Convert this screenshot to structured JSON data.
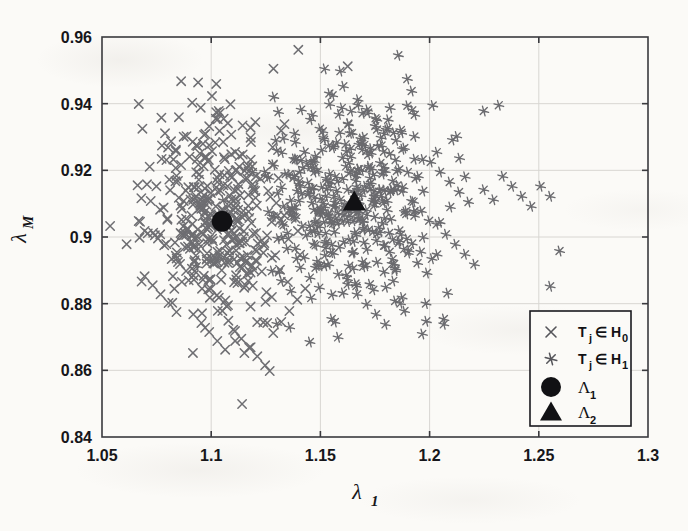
{
  "figure": {
    "background_color": "#fbfaf7",
    "axis_color": "#3a3a3e",
    "grid_color": "#d8d6d2",
    "marker_h0_color": "#6e6e72",
    "marker_h1_color": "#6a6a6e",
    "centroid_color": "#111114"
  },
  "chart_data": {
    "type": "scatter",
    "title": "",
    "xlabel": "λ",
    "xlabel_sub": "1",
    "ylabel": "λ",
    "ylabel_sub": "M",
    "xlim": [
      1.05,
      1.3
    ],
    "ylim": [
      0.84,
      0.96
    ],
    "xticks": [
      1.05,
      1.1,
      1.15,
      1.2,
      1.25,
      1.3
    ],
    "xtick_labels": [
      "1.05",
      "1.1",
      "1.15",
      "1.2",
      "1.25",
      "1.3"
    ],
    "yticks": [
      0.84,
      0.86,
      0.88,
      0.9,
      0.92,
      0.94,
      0.96
    ],
    "ytick_labels": [
      "0.84",
      "0.86",
      "0.88",
      "0.9",
      "0.92",
      "0.94",
      "0.96"
    ],
    "grid": true,
    "legend_position": "lower right",
    "series": [
      {
        "name": "T_j \\in H_0",
        "marker": "x",
        "color": "#6e6e72",
        "center": [
          1.105,
          0.9047
        ],
        "n_points": 420,
        "points": [
          [
            1.0685,
            0.9325
          ],
          [
            1.0772,
            0.9358
          ],
          [
            1.0913,
            0.9403
          ],
          [
            1.0952,
            0.9388
          ],
          [
            1.0991,
            0.9332
          ],
          [
            1.0816,
            0.9287
          ],
          [
            1.0874,
            0.9301
          ],
          [
            1.0931,
            0.9275
          ],
          [
            1.1021,
            0.9355
          ],
          [
            1.1088,
            0.9398
          ],
          [
            1.0663,
            0.9155
          ],
          [
            1.0706,
            0.9158
          ],
          [
            1.0749,
            0.9152
          ],
          [
            1.0668,
            0.9048
          ],
          [
            1.0672,
            0.8998
          ],
          [
            1.0795,
            0.9231
          ],
          [
            1.0838,
            0.9262
          ],
          [
            1.0862,
            0.9216
          ],
          [
            1.0901,
            0.9241
          ],
          [
            1.0946,
            0.9188
          ],
          [
            1.0723,
            0.9108
          ],
          [
            1.0766,
            0.9082
          ],
          [
            1.0799,
            0.9052
          ],
          [
            1.0742,
            0.9005
          ],
          [
            1.0785,
            0.8975
          ],
          [
            1.0848,
            0.9168
          ],
          [
            1.0884,
            0.9139
          ],
          [
            1.0918,
            0.9112
          ],
          [
            1.0955,
            0.9085
          ],
          [
            1.0992,
            0.9058
          ],
          [
            1.0872,
            0.9032
          ],
          [
            1.0908,
            0.9005
          ],
          [
            1.0944,
            0.8978
          ],
          [
            1.0981,
            0.8951
          ],
          [
            1.1018,
            0.8925
          ],
          [
            1.1055,
            0.9285
          ],
          [
            1.1092,
            0.9248
          ],
          [
            1.1128,
            0.9211
          ],
          [
            1.1165,
            0.9175
          ],
          [
            1.1201,
            0.9138
          ],
          [
            1.1038,
            0.9188
          ],
          [
            1.1075,
            0.9152
          ],
          [
            1.1111,
            0.9115
          ],
          [
            1.1148,
            0.9078
          ],
          [
            1.1184,
            0.9042
          ],
          [
            1.1021,
            0.9092
          ],
          [
            1.1058,
            0.9055
          ],
          [
            1.1094,
            0.9018
          ],
          [
            1.1131,
            0.8982
          ],
          [
            1.1167,
            0.8945
          ],
          [
            1.1004,
            0.8995
          ],
          [
            1.1041,
            0.8958
          ],
          [
            1.1077,
            0.8922
          ],
          [
            1.1114,
            0.8885
          ],
          [
            1.1151,
            0.8848
          ],
          [
            1.0925,
            0.8898
          ],
          [
            1.0962,
            0.8872
          ],
          [
            1.0998,
            0.8845
          ],
          [
            1.1035,
            0.8818
          ],
          [
            1.1071,
            0.8792
          ],
          [
            1.0848,
            0.8925
          ],
          [
            1.0885,
            0.8898
          ],
          [
            1.0921,
            0.8872
          ],
          [
            1.0958,
            0.8845
          ],
          [
            1.0994,
            0.8818
          ],
          [
            1.1205,
            0.9012
          ],
          [
            1.1242,
            0.8975
          ],
          [
            1.1278,
            0.8938
          ],
          [
            1.1315,
            0.8902
          ],
          [
            1.1351,
            0.8865
          ],
          [
            1.1188,
            0.9212
          ],
          [
            1.1225,
            0.9175
          ],
          [
            1.1261,
            0.9138
          ],
          [
            1.1298,
            0.9102
          ],
          [
            1.1334,
            0.9065
          ],
          [
            1.0918,
            0.8768
          ],
          [
            1.0955,
            0.8742
          ],
          [
            1.0991,
            0.8715
          ],
          [
            1.1028,
            0.8688
          ],
          [
            1.1064,
            0.8662
          ],
          [
            1.1101,
            0.8722
          ],
          [
            1.1138,
            0.8695
          ],
          [
            1.1174,
            0.8668
          ],
          [
            1.1211,
            0.8642
          ],
          [
            1.1247,
            0.8615
          ],
          [
            1.1284,
            0.8712
          ],
          [
            1.1321,
            0.8745
          ],
          [
            1.1358,
            0.8778
          ],
          [
            1.1394,
            0.8812
          ],
          [
            1.1431,
            0.8845
          ],
          [
            1.0695,
            0.8882
          ],
          [
            1.0732,
            0.8855
          ],
          [
            1.0768,
            0.8828
          ],
          [
            1.0805,
            0.8802
          ],
          [
            1.0841,
            0.8775
          ],
          [
            1.1285,
            0.9505
          ],
          [
            1.1625,
            0.9512
          ],
          [
            1.0695,
            0.9018
          ],
          [
            1.1268,
            0.8598
          ],
          [
            1.1152,
            0.8652
          ]
        ]
      },
      {
        "name": "T_j \\in H_1",
        "marker": "asterisk",
        "color": "#6a6a6e",
        "center": [
          1.165,
          0.9105
        ],
        "n_points": 430,
        "points": [
          [
            1.1412,
            0.9382
          ],
          [
            1.1455,
            0.9352
          ],
          [
            1.1498,
            0.9325
          ],
          [
            1.1542,
            0.9398
          ],
          [
            1.1585,
            0.9368
          ],
          [
            1.1628,
            0.9338
          ],
          [
            1.1672,
            0.9412
          ],
          [
            1.1715,
            0.9382
          ],
          [
            1.1758,
            0.9352
          ],
          [
            1.1802,
            0.9322
          ],
          [
            1.1385,
            0.9285
          ],
          [
            1.1428,
            0.9255
          ],
          [
            1.1472,
            0.9228
          ],
          [
            1.1515,
            0.9298
          ],
          [
            1.1558,
            0.9268
          ],
          [
            1.1602,
            0.9238
          ],
          [
            1.1645,
            0.9312
          ],
          [
            1.1688,
            0.9282
          ],
          [
            1.1732,
            0.9252
          ],
          [
            1.1775,
            0.9222
          ],
          [
            1.1358,
            0.9188
          ],
          [
            1.1402,
            0.9158
          ],
          [
            1.1445,
            0.9128
          ],
          [
            1.1488,
            0.9198
          ],
          [
            1.1532,
            0.9168
          ],
          [
            1.1575,
            0.9138
          ],
          [
            1.1618,
            0.9212
          ],
          [
            1.1662,
            0.9182
          ],
          [
            1.1705,
            0.9152
          ],
          [
            1.1748,
            0.9122
          ],
          [
            1.1332,
            0.9092
          ],
          [
            1.1375,
            0.9062
          ],
          [
            1.1418,
            0.9032
          ],
          [
            1.1462,
            0.9102
          ],
          [
            1.1505,
            0.9072
          ],
          [
            1.1548,
            0.9042
          ],
          [
            1.1592,
            0.9112
          ],
          [
            1.1635,
            0.9082
          ],
          [
            1.1678,
            0.9052
          ],
          [
            1.1722,
            0.9022
          ],
          [
            1.1305,
            0.8995
          ],
          [
            1.1348,
            0.8965
          ],
          [
            1.1392,
            0.8935
          ],
          [
            1.1435,
            0.9005
          ],
          [
            1.1478,
            0.8975
          ],
          [
            1.1522,
            0.8945
          ],
          [
            1.1565,
            0.9015
          ],
          [
            1.1608,
            0.8985
          ],
          [
            1.1652,
            0.8955
          ],
          [
            1.1695,
            0.8925
          ],
          [
            1.1788,
            0.9198
          ],
          [
            1.1832,
            0.9168
          ],
          [
            1.1875,
            0.9138
          ],
          [
            1.1918,
            0.9108
          ],
          [
            1.1962,
            0.9078
          ],
          [
            1.2005,
            0.9225
          ],
          [
            1.2048,
            0.9195
          ],
          [
            1.2092,
            0.9165
          ],
          [
            1.2135,
            0.9135
          ],
          [
            1.2178,
            0.9105
          ],
          [
            1.1815,
            0.9012
          ],
          [
            1.1858,
            0.8982
          ],
          [
            1.1902,
            0.8952
          ],
          [
            1.1945,
            0.8922
          ],
          [
            1.1988,
            0.8892
          ],
          [
            1.2032,
            0.9038
          ],
          [
            1.2075,
            0.9008
          ],
          [
            1.2118,
            0.8978
          ],
          [
            1.2162,
            0.8948
          ],
          [
            1.2205,
            0.8918
          ],
          [
            1.2248,
            0.9142
          ],
          [
            1.2292,
            0.9112
          ],
          [
            1.2335,
            0.9182
          ],
          [
            1.2378,
            0.9152
          ],
          [
            1.2422,
            0.9122
          ],
          [
            1.2465,
            0.9092
          ],
          [
            1.2508,
            0.9152
          ],
          [
            1.2552,
            0.9122
          ],
          [
            1.2595,
            0.8958
          ],
          [
            1.2552,
            0.8852
          ],
          [
            1.1278,
            0.8898
          ],
          [
            1.1322,
            0.8868
          ],
          [
            1.1365,
            0.8838
          ],
          [
            1.1408,
            0.8908
          ],
          [
            1.1452,
            0.8878
          ],
          [
            1.1495,
            0.8848
          ],
          [
            1.1538,
            0.8918
          ],
          [
            1.1582,
            0.8888
          ],
          [
            1.1625,
            0.8858
          ],
          [
            1.1668,
            0.8828
          ],
          [
            1.1712,
            0.8798
          ],
          [
            1.1755,
            0.8768
          ],
          [
            1.1798,
            0.8738
          ],
          [
            1.1842,
            0.8808
          ],
          [
            1.1885,
            0.8778
          ],
          [
            1.1605,
            0.9452
          ],
          [
            1.1918,
            0.9438
          ],
          [
            1.2248,
            0.9378
          ],
          [
            1.1452,
            0.8685
          ],
          [
            1.2065,
            0.8738
          ]
        ]
      }
    ],
    "centroids": [
      {
        "name": "Λ_1",
        "marker": "circle",
        "x": 1.105,
        "y": 0.9047,
        "color": "#111114"
      },
      {
        "name": "Λ_2",
        "marker": "triangle",
        "x": 1.1655,
        "y": 0.9105,
        "color": "#111114"
      }
    ],
    "legend_entries": [
      {
        "marker": "x",
        "label_main": "T",
        "label_sub": "j",
        "label_rest": "∈ H",
        "label_rest_sub": "0"
      },
      {
        "marker": "asterisk",
        "label_main": "T",
        "label_sub": "j",
        "label_rest": "∈ H",
        "label_rest_sub": "1"
      },
      {
        "marker": "circle",
        "label_main": "Λ",
        "label_sub": "1",
        "label_rest": "",
        "label_rest_sub": ""
      },
      {
        "marker": "triangle",
        "label_main": "Λ",
        "label_sub": "2",
        "label_rest": "",
        "label_rest_sub": ""
      }
    ]
  }
}
